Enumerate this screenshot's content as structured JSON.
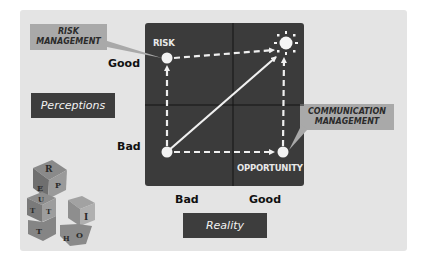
{
  "diagram": {
    "callouts": {
      "risk_management": [
        "RISK",
        "MANAGEMENT"
      ],
      "communication_management": [
        "COMMUNICATION",
        "MANAGEMENT"
      ]
    },
    "axes": {
      "y_title": "Perceptions",
      "x_title": "Reality",
      "y_ticks": {
        "top": "Good",
        "bottom": "Bad"
      },
      "x_ticks": {
        "left": "Bad",
        "right": "Good"
      }
    },
    "nodes": {
      "top_left": "RISK",
      "bottom_right": "OPPORTUNITY",
      "top_right_icon": "sun-icon",
      "bottom_left": ""
    },
    "decoration": {
      "icon": "truth-blocks-icon",
      "letters": [
        "R",
        "E",
        "U",
        "T",
        "T",
        "I",
        "H"
      ]
    },
    "colors": {
      "panel": "#e4e4e4",
      "quadrant_bg": "#3b3b3b",
      "callout_bg": "#a9a9a9",
      "axis_box_bg": "#3d3d3d",
      "arrows": "#f0f0f0"
    }
  }
}
